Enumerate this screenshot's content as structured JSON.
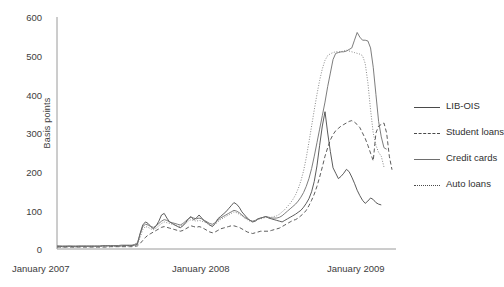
{
  "chart_data": {
    "type": "line",
    "title": "",
    "xlabel": "",
    "ylabel": "Basis points",
    "ylim": [
      0,
      600
    ],
    "yticks": [
      0,
      100,
      200,
      300,
      400,
      500,
      600
    ],
    "xticks": [
      "January 2007",
      "January 2008",
      "January 2009"
    ],
    "xtick_positions": [
      0,
      52,
      104
    ],
    "xlim": [
      0,
      121
    ],
    "grid": false,
    "legend_position": "right",
    "colors": {
      "lib_ois": "#4a4a4a",
      "student_loans": "#4a4a4a",
      "credit_cards": "#6e6e6e",
      "auto_loans": "#7a7a7a",
      "axis": "#8a8a8a",
      "text": "#3d3d3d"
    },
    "series": [
      {
        "name": "LIB-OIS",
        "style": "solid",
        "color": "#4a4a4a",
        "values": [
          7,
          7,
          6,
          6,
          7,
          7,
          6,
          6,
          7,
          7,
          7,
          7,
          7,
          7,
          7,
          7,
          7,
          8,
          8,
          8,
          8,
          8,
          8,
          8,
          8,
          9,
          9,
          9,
          9,
          10,
          12,
          40,
          62,
          70,
          66,
          58,
          52,
          60,
          72,
          88,
          92,
          80,
          70,
          66,
          62,
          58,
          55,
          60,
          68,
          78,
          84,
          76,
          80,
          88,
          80,
          72,
          68,
          62,
          58,
          66,
          78,
          84,
          90,
          96,
          104,
          112,
          120,
          116,
          108,
          96,
          88,
          80,
          74,
          70,
          72,
          78,
          80,
          82,
          84,
          80,
          78,
          76,
          74,
          72,
          70,
          74,
          78,
          82,
          86,
          90,
          95,
          100,
          108,
          118,
          130,
          148,
          175,
          215,
          268,
          318,
          355,
          300,
          252,
          210,
          196,
          182,
          188,
          196,
          206,
          200,
          186,
          170,
          152,
          138,
          126,
          118,
          124,
          132,
          128,
          120,
          116,
          114
        ]
      },
      {
        "name": "Student loans",
        "style": "dashed",
        "color": "#4a4a4a",
        "values": [
          5,
          5,
          5,
          5,
          5,
          5,
          5,
          5,
          5,
          5,
          5,
          5,
          5,
          5,
          5,
          5,
          5,
          5,
          5,
          5,
          6,
          6,
          6,
          6,
          6,
          6,
          6,
          6,
          6,
          7,
          8,
          14,
          22,
          30,
          36,
          40,
          44,
          48,
          52,
          56,
          58,
          56,
          54,
          52,
          50,
          48,
          46,
          48,
          52,
          56,
          60,
          58,
          56,
          58,
          56,
          52,
          48,
          44,
          42,
          44,
          48,
          52,
          54,
          56,
          58,
          60,
          60,
          58,
          56,
          52,
          48,
          44,
          42,
          40,
          42,
          44,
          46,
          46,
          46,
          46,
          48,
          50,
          52,
          54,
          58,
          62,
          66,
          70,
          74,
          76,
          80,
          86,
          92,
          100,
          112,
          126,
          142,
          162,
          186,
          212,
          240,
          262,
          282,
          296,
          306,
          312,
          318,
          322,
          326,
          330,
          332,
          328,
          322,
          314,
          300,
          286,
          268,
          248,
          228,
          300,
          318,
          322,
          326,
          300,
          240,
          205
        ]
      },
      {
        "name": "Credit cards",
        "style": "solid",
        "color": "#6e6e6e",
        "values": [
          8,
          8,
          8,
          8,
          8,
          8,
          8,
          8,
          8,
          8,
          8,
          8,
          8,
          8,
          8,
          8,
          8,
          9,
          9,
          9,
          9,
          9,
          9,
          9,
          10,
          10,
          10,
          10,
          10,
          12,
          16,
          38,
          58,
          64,
          62,
          58,
          56,
          60,
          66,
          72,
          76,
          74,
          70,
          68,
          66,
          64,
          62,
          66,
          72,
          78,
          82,
          80,
          78,
          80,
          78,
          74,
          70,
          66,
          64,
          68,
          74,
          80,
          84,
          88,
          92,
          96,
          100,
          98,
          94,
          88,
          82,
          78,
          74,
          72,
          74,
          78,
          80,
          82,
          84,
          82,
          80,
          80,
          80,
          82,
          86,
          92,
          98,
          104,
          110,
          116,
          124,
          134,
          146,
          162,
          182,
          208,
          240,
          275,
          310,
          345,
          380,
          420,
          455,
          490,
          506,
          508,
          510,
          510,
          512,
          516,
          520,
          540,
          560,
          548,
          540,
          540,
          538,
          520,
          470,
          400,
          330,
          290,
          262,
          258
        ]
      },
      {
        "name": "Auto loans",
        "style": "dotted",
        "color": "#7a7a7a",
        "values": [
          6,
          6,
          6,
          6,
          6,
          6,
          6,
          6,
          6,
          6,
          6,
          6,
          6,
          6,
          6,
          6,
          6,
          7,
          7,
          7,
          7,
          7,
          7,
          7,
          7,
          8,
          8,
          8,
          8,
          9,
          11,
          30,
          50,
          58,
          56,
          52,
          50,
          54,
          60,
          66,
          70,
          68,
          66,
          64,
          62,
          60,
          58,
          62,
          66,
          72,
          76,
          74,
          72,
          74,
          72,
          70,
          66,
          62,
          60,
          64,
          70,
          76,
          80,
          84,
          88,
          92,
          96,
          94,
          90,
          86,
          80,
          76,
          72,
          70,
          72,
          76,
          78,
          80,
          82,
          82,
          82,
          84,
          86,
          90,
          96,
          102,
          110,
          118,
          128,
          140,
          156,
          176,
          202,
          236,
          276,
          318,
          360,
          400,
          436,
          466,
          488,
          500,
          505,
          508,
          510,
          510,
          510,
          512,
          514,
          512,
          510,
          508,
          506,
          504,
          500,
          480,
          430,
          360,
          300,
          268,
          250,
          240,
          212
        ]
      }
    ]
  },
  "legend": {
    "items": [
      {
        "label": "LIB-OIS",
        "style": "solid"
      },
      {
        "label": "Student loans",
        "style": "dashed"
      },
      {
        "label": "Credit cards",
        "style": "solid2"
      },
      {
        "label": "Auto loans",
        "style": "dotted"
      }
    ]
  },
  "axes": {
    "y_title": "Basis points",
    "y_tick_labels": [
      "600",
      "500",
      "400",
      "300",
      "200",
      "100",
      "0"
    ],
    "x_tick_labels": [
      "January 2007",
      "January 2008",
      "January 2009"
    ]
  }
}
